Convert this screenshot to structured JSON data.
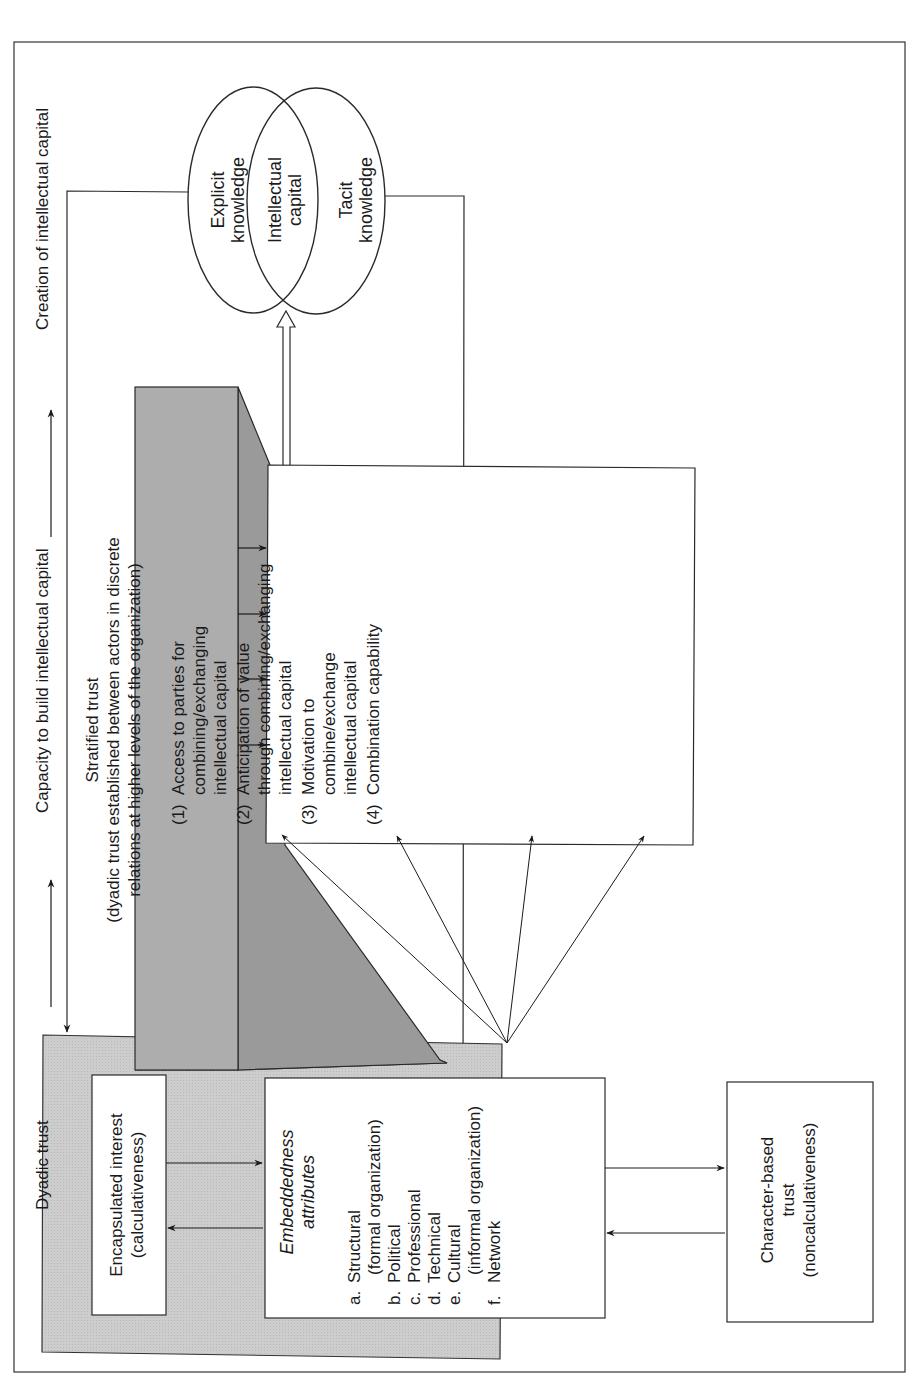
{
  "figure": {
    "orientation": "rotated-90-ccw",
    "axis_labels": {
      "dyadic": "Dyadic trust",
      "capacity": "Capacity to build intellectual capital",
      "creation": "Creation of intellectual capital"
    },
    "stratified_trust": {
      "title": "Stratified trust",
      "line1": "(dyadic trust established between actors in discrete",
      "line2": "relations at higher levels of the organization)"
    },
    "factors": [
      {
        "num": "(1)",
        "lines": [
          "Access to parties for",
          "combining/exchanging",
          "intellectual capital"
        ]
      },
      {
        "num": "(2)",
        "lines": [
          "Anticipation of value",
          "through combining/exchanging",
          "intellectual capital"
        ]
      },
      {
        "num": "(3)",
        "lines": [
          "Motivation to",
          "combine/exchange",
          "intellectual capital"
        ]
      },
      {
        "num": "(4)",
        "lines": [
          "Combination capability"
        ]
      }
    ],
    "venn": {
      "left": [
        "Explicit",
        "knowledge"
      ],
      "middle": [
        "Intellectual",
        "capital"
      ],
      "right": [
        "Tacit",
        "knowledge"
      ]
    },
    "dyadic_box": {
      "encapsulated": [
        "Encapsulated interest",
        "(calculativeness)"
      ],
      "embeddedness_title": [
        "Embeddedness",
        "attributes"
      ],
      "attributes": [
        {
          "letter": "a.",
          "label": "Structural",
          "sub": "(formal organization)"
        },
        {
          "letter": "b.",
          "label": "Political",
          "sub": ""
        },
        {
          "letter": "c.",
          "label": "Professional",
          "sub": ""
        },
        {
          "letter": "d.",
          "label": "Technical",
          "sub": ""
        },
        {
          "letter": "e.",
          "label": "Cultural",
          "sub": "(informal organization)"
        },
        {
          "letter": "f.",
          "label": "Network",
          "sub": ""
        }
      ],
      "character": [
        "Character-based",
        "trust",
        "(noncalculativeness)"
      ]
    },
    "colors": {
      "line": "#2a2a2a",
      "dyadic_fill": "#cfcfcf",
      "strat_front": "#a9a9a9",
      "strat_side": "#969696",
      "strat_bottom": "#c4c4c4"
    }
  }
}
